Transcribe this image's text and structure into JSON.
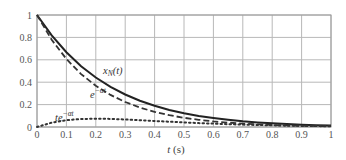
{
  "chart_data": {
    "type": "line",
    "title": "",
    "xlabel": "t (s)",
    "ylabel": "",
    "xlim": [
      0,
      1
    ],
    "ylim": [
      0,
      1
    ],
    "grid": true,
    "x_ticks": [
      "0",
      "0.1",
      "0.2",
      "0.3",
      "0.4",
      "0.5",
      "0.6",
      "0.7",
      "0.8",
      "0.9",
      "1"
    ],
    "y_ticks": [
      "0",
      "0.2",
      "0.4",
      "0.6",
      "0.8",
      "1"
    ],
    "x": [
      0,
      0.05,
      0.1,
      0.15,
      0.2,
      0.25,
      0.3,
      0.35,
      0.4,
      0.45,
      0.5,
      0.55,
      0.6,
      0.65,
      0.7,
      0.75,
      0.8,
      0.85,
      0.9,
      0.95,
      1.0
    ],
    "series": [
      {
        "name": "x_N(t)",
        "style": "solid",
        "values": [
          1.0,
          0.818,
          0.668,
          0.543,
          0.442,
          0.359,
          0.29,
          0.235,
          0.189,
          0.152,
          0.123,
          0.099,
          0.08,
          0.064,
          0.051,
          0.041,
          0.033,
          0.026,
          0.02,
          0.016,
          0.013
        ]
      },
      {
        "name": "e^{-αt}",
        "style": "dashed",
        "values": [
          1.0,
          0.779,
          0.607,
          0.472,
          0.368,
          0.287,
          0.223,
          0.174,
          0.135,
          0.105,
          0.082,
          0.064,
          0.05,
          0.039,
          0.03,
          0.024,
          0.018,
          0.014,
          0.011,
          0.009,
          0.007
        ]
      },
      {
        "name": "te^{-αt}",
        "style": "dotted",
        "values": [
          0.0,
          0.039,
          0.061,
          0.071,
          0.074,
          0.072,
          0.067,
          0.061,
          0.054,
          0.047,
          0.041,
          0.035,
          0.03,
          0.025,
          0.021,
          0.018,
          0.015,
          0.012,
          0.01,
          0.008,
          0.007
        ]
      }
    ],
    "annotations": [
      {
        "text": "x_N(t)",
        "x": 0.24,
        "y": 0.48
      },
      {
        "text": "e^{-αt}",
        "x": 0.17,
        "y": 0.23
      },
      {
        "text": "te^{-αt}",
        "x": 0.05,
        "y": 0.08
      }
    ]
  },
  "labels": {
    "xn_main": "x",
    "xn_sub": "N",
    "xn_tail": "(t)",
    "exp_base": "e",
    "exp_sup": "−αt",
    "texp_base": "te",
    "texp_sup": "−αt",
    "xaxis_t": "t",
    "xaxis_unit": " (s)"
  }
}
